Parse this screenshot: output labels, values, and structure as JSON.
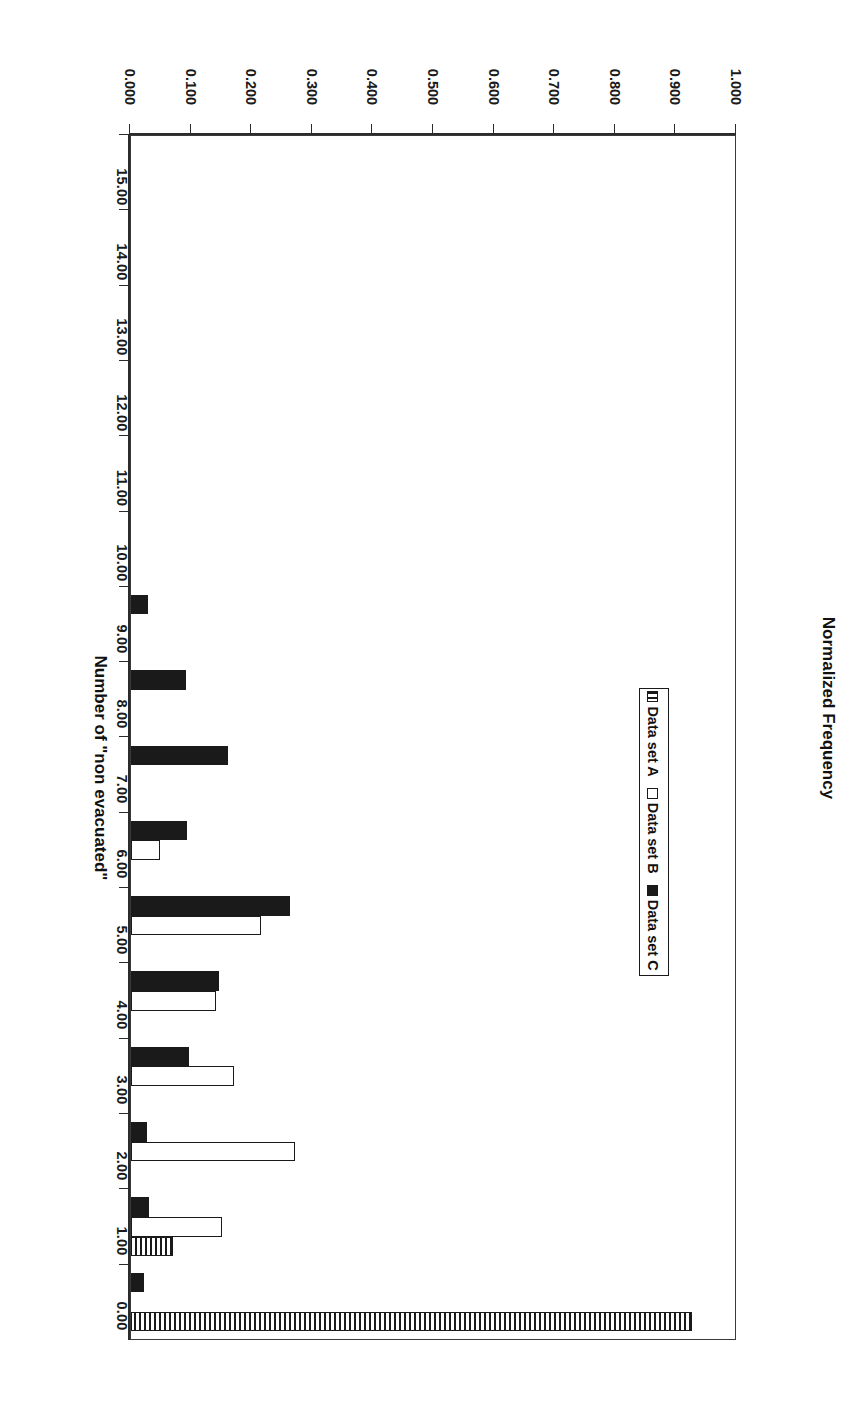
{
  "chart_data": {
    "type": "bar",
    "title": "",
    "xlabel": "Number of \"non evacuated\"",
    "ylabel": "Normalized Frequency",
    "orientation": "vertical",
    "grid": false,
    "legend_position": "upper-right",
    "xlim": [
      0,
      15
    ],
    "ylim": [
      0,
      1.0
    ],
    "x_tick_labels": [
      "0.00",
      "1.00",
      "2.00",
      "3.00",
      "4.00",
      "5.00",
      "6.00",
      "7.00",
      "8.00",
      "9.00",
      "10.00",
      "11.00",
      "12.00",
      "13.00",
      "14.00",
      "15.00"
    ],
    "y_tick_labels": [
      "0.000",
      "0.100",
      "0.200",
      "0.300",
      "0.400",
      "0.500",
      "0.600",
      "0.700",
      "0.800",
      "0.900",
      "1.000"
    ],
    "y_tick_values": [
      0.0,
      0.1,
      0.2,
      0.3,
      0.4,
      0.5,
      0.6,
      0.7,
      0.8,
      0.9,
      1.0
    ],
    "categories": [
      0,
      1,
      2,
      3,
      4,
      5,
      6,
      7,
      8,
      9,
      10,
      11,
      12,
      13,
      14,
      15
    ],
    "series": [
      {
        "name": "Data set A",
        "fill": "hatched",
        "values": [
          0.925,
          0.07,
          0.0,
          0.0,
          0.0,
          0.0,
          0.0,
          0.0,
          0.0,
          0.0,
          0.0,
          0.0,
          0.0,
          0.0,
          0.0,
          0.0
        ]
      },
      {
        "name": "Data set B",
        "fill": "white",
        "values": [
          0.0,
          0.15,
          0.27,
          0.17,
          0.14,
          0.215,
          0.048,
          0.0,
          0.0,
          0.0,
          0.0,
          0.0,
          0.0,
          0.0,
          0.0,
          0.0
        ]
      },
      {
        "name": "Data set C",
        "fill": "black",
        "values": [
          0.022,
          0.03,
          0.027,
          0.095,
          0.145,
          0.263,
          0.092,
          0.16,
          0.09,
          0.028,
          0.0,
          0.0,
          0.0,
          0.0,
          0.0,
          0.0
        ]
      }
    ]
  },
  "legend": {
    "items": [
      {
        "label": "Data set A",
        "swatch": "hatched-swatch"
      },
      {
        "label": "Data set B",
        "swatch": "white-swatch"
      },
      {
        "label": "Data set C",
        "swatch": "black-swatch"
      }
    ]
  },
  "axes": {
    "category_title": "Number of \"non evacuated\"",
    "value_title": "Normalized Frequency"
  }
}
